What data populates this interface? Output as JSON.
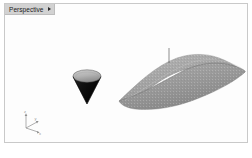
{
  "window": {
    "title": "Perspective",
    "background_color": "#ffffff"
  },
  "viewport": {
    "name": "perspective-viewport",
    "background_color": "#fdfdfd",
    "border_color": "#c9c9c9",
    "tab": {
      "label": "Perspective",
      "menu_icon": "chevron-right-icon",
      "tab_color": "#d2d2d2",
      "text_color": "#1c1c1c"
    }
  },
  "scene": {
    "objects": [
      {
        "name": "cone",
        "label": "Cone",
        "orientation": "apex-down",
        "cap_fill": "#b4b4b4",
        "body_fill": "#111111",
        "edge_color": "#4a4a4a"
      },
      {
        "name": "surface",
        "label": "Wave Surface",
        "type": "freeform-nurbs-surface",
        "fill": "#9e9e9e",
        "edge_color": "#6e6e6e",
        "marker": {
          "name": "peak-marker",
          "type": "vertical-line",
          "color": "#5c5c5c"
        }
      }
    ],
    "axis_gizmo": {
      "name": "axis-triad",
      "labels": {
        "x": "x",
        "y": "y",
        "z": "z"
      },
      "color": "#8d8d8d",
      "text_color": "#9a9a9a"
    }
  },
  "caption": {
    "text": ""
  }
}
